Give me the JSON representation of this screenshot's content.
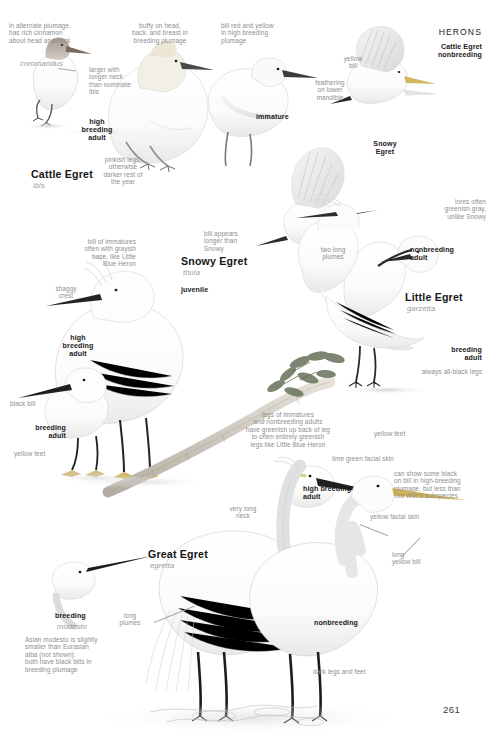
{
  "header": {
    "section": "HERONS"
  },
  "footer": {
    "page_number": "261"
  },
  "species": {
    "cattle_egret": {
      "common": "Cattle Egret",
      "subspecies": "ibis",
      "subspecies_coromandus": "coromandus",
      "flight_label": "Cattle Egret\nnonbreeding"
    },
    "snowy_egret": {
      "common": "Snowy Egret",
      "subspecies": "thula",
      "flight_label": "Snowy\nEgret"
    },
    "little_egret": {
      "common": "Little Egret",
      "subspecies": "garzetta"
    },
    "great_egret": {
      "common": "Great Egret",
      "subspecies": "egretta",
      "subspecies_modesto": "modesto"
    }
  },
  "plumages": {
    "high_breeding_adult": "high\nbreeding\nadult",
    "high_breeding_adult_inline": "high breeding\nadult",
    "breeding_adult": "breeding\nadult",
    "nonbreeding_adult": "nonbreeding\nadult",
    "nonbreeding": "nonbreeding",
    "breeding": "breeding",
    "immature": "immature",
    "juvenile": "juvenile"
  },
  "notes": {
    "alternate_plumage": "in alternate plumage,\nhas rich cinnamon\nabout head and neck",
    "larger_longer_neck": "larger with\nlonger neck\nthan nominate\nibis",
    "buffy_head": "buffy on head,\nback, and breast in\nbreeding plumage",
    "bill_red_and_yellow": "bill red and yellow\nin high breeding\nplumage",
    "yellow_bill": "yellow\nbill",
    "feathering_lower_mandible": "feathering\non lower\nmandible",
    "pinkish_legs": "pinkish legs,\notherwise\ndarker rest of\nthe year",
    "bill_of_immatures": "bill of immatures\noften with grayish\nbase, like Little\nBlue Heron",
    "shaggy_crest": "shaggy\ncrest",
    "bill_appears_longer": "bill appears\nlonger than\nSnowy",
    "two_long_plumes": "two long\nplumes",
    "lores_greenish_gray": "lores often\ngreenish gray,\nunlike Snowy",
    "always_all_black_legs": "always all-black legs",
    "black_bill": "black bill",
    "yellow_feet": "yellow feet",
    "legs_of_immatures": "legs of immatures\nand nonbreeding adults\nhave greenish up back of leg\nto often entirely greenish\nlegs like Little Blue Heron",
    "lime_green_facial_skin": "lime green facial skin",
    "can_show_some_black": "can show some black\non bill in high-breeding\nplumage, but less than\nOld World subspecies",
    "yellow_facial_skin": "yellow facial skin",
    "very_long_neck": "very long\nneck",
    "long_yellow_bill": "long\nyellow bill",
    "long_plumes": "long\nplumes",
    "asian_modesto": "Asian modesto is slightly\nsmaller than Eurasian\nalba (not shown);\nboth have black bills in\nbreeding plumage",
    "dark_legs_and_feet": "dark legs and feet"
  }
}
